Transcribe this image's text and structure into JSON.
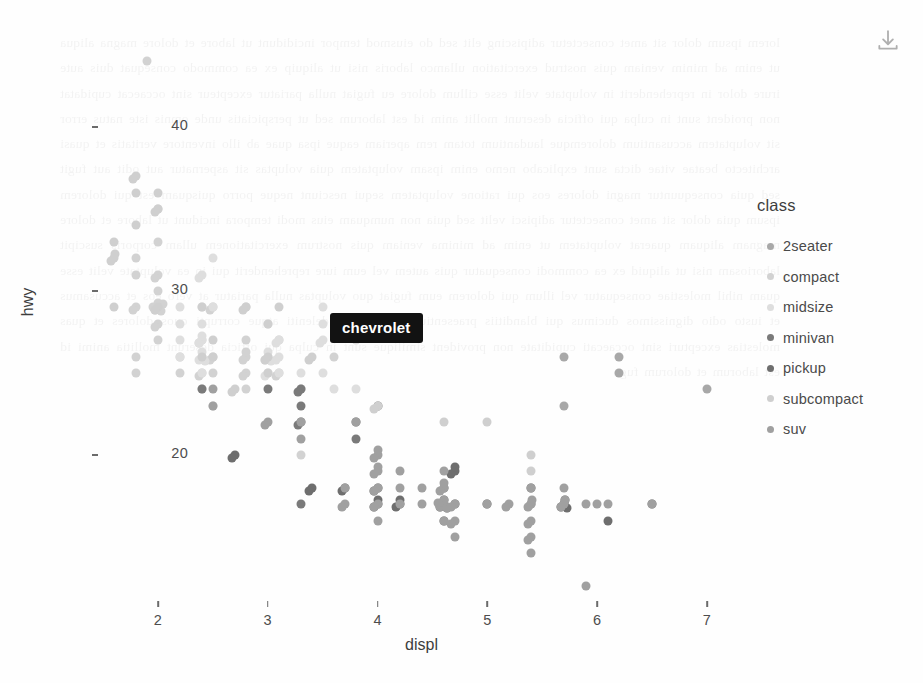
{
  "toolbar": {
    "export_icon": "download-icon",
    "export_label": "Download plot"
  },
  "tooltip": {
    "text": "chevrolet"
  },
  "legend": {
    "title": "class",
    "items": [
      {
        "label": "2seater",
        "color": "#a8a8a8"
      },
      {
        "label": "compact",
        "color": "#d2d2d2"
      },
      {
        "label": "midsize",
        "color": "#dedede"
      },
      {
        "label": "minivan",
        "color": "#7a7a7a"
      },
      {
        "label": "pickup",
        "color": "#6e6e6e"
      },
      {
        "label": "subcompact",
        "color": "#cfcfcf"
      },
      {
        "label": "suv",
        "color": "#a0a0a0"
      }
    ]
  },
  "watermark": {
    "text": "lorem ipsum dolor sit amet consectetur adipiscing elit sed do eiusmod tempor incididunt ut labore et dolore magna aliqua ut enim ad minim veniam quis nostrud exercitation ullamco laboris nisi ut aliquip ex ea commodo consequat duis aute irure dolor in reprehenderit in voluptate velit esse cillum dolore eu fugiat nulla pariatur excepteur sint occaecat cupidatat non proident sunt in culpa qui officia deserunt mollit anim id est laborum sed ut perspiciatis unde omnis iste natus error sit voluptatem accusantium doloremque laudantium totam rem aperiam eaque ipsa quae ab illo inventore veritatis et quasi architecto beatae vitae dicta sunt explicabo nemo enim ipsam voluptatem quia voluptas sit aspernatur aut odit aut fugit sed quia consequuntur magni dolores eos qui ratione voluptatem sequi nesciunt neque porro quisquam est qui dolorem ipsum quia dolor sit amet consectetur adipisci velit sed quia non numquam eius modi tempora incidunt ut labore et dolore magnam aliquam quaerat voluptatem ut enim ad minima veniam quis nostrum exercitationem ullam corporis suscipit laboriosam nisi ut aliquid ex ea commodi consequatur quis autem vel eum iure reprehenderit qui in ea voluptate velit esse quam nihil molestiae consequatur vel illum qui dolorem eum fugiat quo voluptas nulla pariatur at vero eos et accusamus et iusto odio dignissimos ducimus qui blanditiis praesentium voluptatum deleniti atque corrupti quos dolores et quas molestias excepturi sint occaecati cupiditate non provident similique sunt in culpa qui officia deserunt mollitia animi id est laborum et dolorum fuga"
  },
  "chart_data": {
    "type": "scatter",
    "title": "",
    "xlabel": "displ",
    "ylabel": "hwy",
    "xlim": [
      1.45,
      7.45
    ],
    "ylim": [
      10.5,
      45.5
    ],
    "xticks": [
      2,
      3,
      4,
      5,
      6,
      7
    ],
    "yticks": [
      20,
      30,
      40
    ],
    "grid": false,
    "legend_position": "right",
    "legend_title": "class",
    "series": [
      {
        "name": "2seater",
        "color": "#a8a8a8",
        "points": [
          [
            5.7,
            26
          ],
          [
            5.7,
            23
          ],
          [
            6.2,
            26
          ],
          [
            6.2,
            25
          ],
          [
            7.0,
            24
          ]
        ]
      },
      {
        "name": "compact",
        "color": "#d2d2d2",
        "points": [
          [
            1.8,
            29
          ],
          [
            1.8,
            29
          ],
          [
            2.0,
            31
          ],
          [
            2.0,
            30
          ],
          [
            2.8,
            26
          ],
          [
            2.8,
            26
          ],
          [
            3.1,
            27
          ],
          [
            1.8,
            26
          ],
          [
            1.8,
            25
          ],
          [
            2.0,
            28
          ],
          [
            2.0,
            27
          ],
          [
            2.8,
            25
          ],
          [
            2.8,
            25
          ],
          [
            3.1,
            25
          ],
          [
            3.1,
            25
          ],
          [
            2.4,
            27
          ],
          [
            2.4,
            25
          ],
          [
            2.5,
            26
          ],
          [
            2.5,
            25
          ],
          [
            3.3,
            24
          ],
          [
            2.0,
            33
          ],
          [
            2.0,
            35
          ],
          [
            2.8,
            29
          ],
          [
            1.9,
            44
          ],
          [
            2.0,
            29
          ],
          [
            2.0,
            29
          ],
          [
            2.5,
            29
          ],
          [
            2.5,
            29
          ],
          [
            1.8,
            31
          ],
          [
            1.8,
            32
          ],
          [
            2.0,
            31
          ],
          [
            2.0,
            28
          ],
          [
            2.8,
            26
          ],
          [
            2.8,
            27
          ],
          [
            3.6,
            26
          ],
          [
            2.2,
            26
          ],
          [
            2.2,
            25
          ],
          [
            2.4,
            24
          ],
          [
            2.4,
            27
          ],
          [
            2.4,
            25
          ],
          [
            2.5,
            26
          ],
          [
            2.5,
            23
          ],
          [
            3.3,
            20
          ],
          [
            2.0,
            29
          ],
          [
            2.0,
            29
          ],
          [
            2.0,
            29
          ],
          [
            2.0,
            29
          ],
          [
            2.8,
            24
          ]
        ]
      },
      {
        "name": "midsize",
        "color": "#dedede",
        "points": [
          [
            2.4,
            27
          ],
          [
            2.4,
            26
          ],
          [
            3.1,
            26
          ],
          [
            3.5,
            29
          ],
          [
            2.4,
            26
          ],
          [
            2.4,
            27
          ],
          [
            3.1,
            26
          ],
          [
            3.1,
            25
          ],
          [
            2.4,
            26
          ],
          [
            2.4,
            28
          ],
          [
            3.1,
            27
          ],
          [
            3.1,
            27
          ],
          [
            3.0,
            26
          ],
          [
            3.3,
            25
          ],
          [
            3.3,
            24
          ],
          [
            3.8,
            24
          ],
          [
            3.8,
            27
          ],
          [
            2.5,
            32
          ],
          [
            2.5,
            29
          ],
          [
            3.0,
            26
          ],
          [
            3.0,
            25
          ],
          [
            3.5,
            28
          ],
          [
            3.5,
            27
          ],
          [
            2.2,
            28
          ],
          [
            2.2,
            29
          ],
          [
            2.4,
            31
          ],
          [
            2.4,
            31
          ],
          [
            3.0,
            26
          ],
          [
            3.0,
            26
          ],
          [
            3.5,
            27
          ],
          [
            2.2,
            26
          ],
          [
            2.2,
            27
          ],
          [
            2.4,
            26
          ],
          [
            2.4,
            25
          ],
          [
            3.0,
            28
          ],
          [
            3.0,
            25
          ],
          [
            3.5,
            25
          ],
          [
            3.6,
            24
          ],
          [
            2.4,
            29
          ],
          [
            2.4,
            27
          ]
        ]
      },
      {
        "name": "minivan",
        "color": "#7a7a7a",
        "points": [
          [
            2.4,
            24
          ],
          [
            3.0,
            24
          ],
          [
            3.3,
            22
          ],
          [
            3.3,
            22
          ],
          [
            3.3,
            24
          ],
          [
            3.3,
            24
          ],
          [
            3.3,
            17
          ],
          [
            3.8,
            22
          ],
          [
            3.8,
            21
          ],
          [
            4.0,
            23
          ],
          [
            3.3,
            23
          ]
        ]
      },
      {
        "name": "pickup",
        "color": "#6e6e6e",
        "points": [
          [
            4.7,
            19
          ],
          [
            5.7,
            17
          ],
          [
            5.7,
            17
          ],
          [
            6.5,
            17
          ],
          [
            2.7,
            20
          ],
          [
            2.7,
            20
          ],
          [
            3.4,
            18
          ],
          [
            3.4,
            18
          ],
          [
            4.0,
            17
          ],
          [
            4.0,
            17
          ],
          [
            4.7,
            19
          ],
          [
            4.7,
            19
          ],
          [
            4.7,
            17
          ],
          [
            5.7,
            17
          ],
          [
            5.7,
            17
          ],
          [
            6.1,
            16
          ],
          [
            4.0,
            17
          ],
          [
            4.2,
            17
          ],
          [
            4.6,
            17
          ],
          [
            4.6,
            18
          ],
          [
            5.4,
            18
          ],
          [
            5.4,
            17
          ],
          [
            3.7,
            18
          ],
          [
            3.7,
            18
          ],
          [
            4.0,
            18
          ],
          [
            4.0,
            18
          ],
          [
            4.6,
            16
          ],
          [
            5.0,
            17
          ],
          [
            4.2,
            17
          ],
          [
            4.2,
            17
          ],
          [
            4.6,
            17
          ],
          [
            4.6,
            17
          ],
          [
            4.6,
            17
          ]
        ]
      },
      {
        "name": "subcompact",
        "color": "#cfcfcf",
        "points": [
          [
            1.8,
            37
          ],
          [
            1.8,
            37
          ],
          [
            2.0,
            35
          ],
          [
            2.0,
            35
          ],
          [
            2.8,
            29
          ],
          [
            2.8,
            29
          ],
          [
            3.1,
            29
          ],
          [
            2.5,
            27
          ],
          [
            2.5,
            26
          ],
          [
            1.6,
            33
          ],
          [
            1.6,
            32
          ],
          [
            1.6,
            32
          ],
          [
            1.6,
            29
          ],
          [
            1.6,
            32
          ],
          [
            1.8,
            34
          ],
          [
            1.8,
            36
          ],
          [
            2.0,
            36
          ],
          [
            2.4,
            29
          ],
          [
            2.4,
            26
          ],
          [
            3.0,
            26
          ],
          [
            3.0,
            28
          ],
          [
            3.4,
            26
          ],
          [
            3.4,
            26
          ],
          [
            5.4,
            20
          ],
          [
            5.4,
            19
          ],
          [
            5.4,
            17
          ],
          [
            4.0,
            23
          ],
          [
            4.0,
            23
          ],
          [
            4.6,
            22
          ],
          [
            5.0,
            22
          ],
          [
            2.0,
            29
          ],
          [
            2.0,
            29
          ],
          [
            2.7,
            24
          ],
          [
            2.7,
            24
          ],
          [
            3.0,
            26
          ],
          [
            3.0,
            25
          ]
        ]
      },
      {
        "name": "suv",
        "color": "#a0a0a0",
        "points": [
          [
            4.2,
            17
          ],
          [
            4.6,
            17
          ],
          [
            4.6,
            17
          ],
          [
            4.6,
            16
          ],
          [
            4.6,
            17
          ],
          [
            5.4,
            17
          ],
          [
            5.4,
            15
          ],
          [
            4.0,
            19
          ],
          [
            4.0,
            20
          ],
          [
            4.6,
            17
          ],
          [
            5.0,
            17
          ],
          [
            4.2,
            18
          ],
          [
            4.4,
            17
          ],
          [
            4.6,
            17
          ],
          [
            5.4,
            16
          ],
          [
            5.4,
            15
          ],
          [
            4.0,
            17
          ],
          [
            4.7,
            15
          ],
          [
            4.7,
            16
          ],
          [
            5.7,
            17
          ],
          [
            5.7,
            17
          ],
          [
            6.1,
            17
          ],
          [
            4.0,
            19
          ],
          [
            4.2,
            19
          ],
          [
            4.4,
            18
          ],
          [
            4.6,
            19
          ],
          [
            5.4,
            14
          ],
          [
            5.4,
            16
          ],
          [
            3.8,
            22
          ],
          [
            4.0,
            19
          ],
          [
            4.0,
            18
          ],
          [
            4.6,
            18
          ],
          [
            4.6,
            18
          ],
          [
            5.4,
            17
          ],
          [
            5.4,
            17
          ],
          [
            5.9,
            12
          ],
          [
            3.7,
            17
          ],
          [
            3.7,
            17
          ],
          [
            4.0,
            16
          ],
          [
            4.0,
            17
          ],
          [
            4.7,
            16
          ],
          [
            4.7,
            17
          ],
          [
            5.2,
            17
          ],
          [
            5.2,
            17
          ],
          [
            5.7,
            17
          ],
          [
            5.9,
            17
          ],
          [
            4.6,
            18
          ],
          [
            5.4,
            18
          ],
          [
            2.5,
            23
          ],
          [
            2.5,
            24
          ],
          [
            3.0,
            22
          ],
          [
            3.0,
            22
          ],
          [
            3.3,
            22
          ],
          [
            3.3,
            21
          ],
          [
            3.7,
            18
          ],
          [
            4.0,
            18
          ],
          [
            4.7,
            17
          ],
          [
            5.7,
            18
          ],
          [
            6.0,
            17
          ],
          [
            6.5,
            17
          ],
          [
            4.0,
            20
          ],
          [
            4.0,
            20
          ]
        ]
      }
    ]
  }
}
